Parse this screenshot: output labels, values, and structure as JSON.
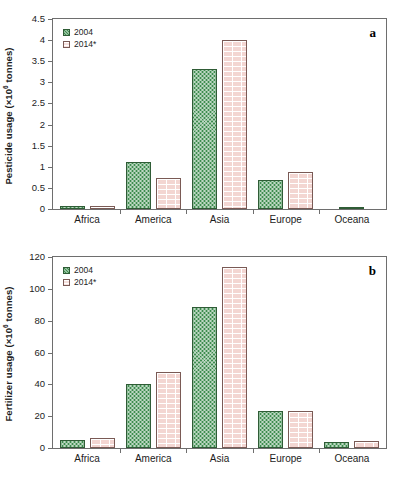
{
  "figure": {
    "background_color": "#ffffff",
    "series_colors": {
      "2004": "#3d8c4e",
      "2014*": "#f3d6d2"
    }
  },
  "panels": [
    {
      "letter": "a",
      "legend": [
        "2004",
        "2014*"
      ],
      "ylabel_pre": "Pesticide usage (×10",
      "ylabel_sup": "6",
      "ylabel_post": " tonnes)",
      "yticks": [
        "4.5",
        "4",
        "3.5",
        "3",
        "2.5",
        "2",
        "1.5",
        "1",
        "0.5",
        "0"
      ],
      "categories": [
        "Africa",
        "America",
        "Asia",
        "Europe",
        "Oceana"
      ]
    },
    {
      "letter": "b",
      "legend": [
        "2004",
        "2014*"
      ],
      "ylabel_pre": "Fertilizer usage (×10",
      "ylabel_sup": "6",
      "ylabel_post": " tonnes)",
      "yticks": [
        "120",
        "100",
        "80",
        "60",
        "40",
        "20",
        "0"
      ],
      "categories": [
        "Africa",
        "America",
        "Asia",
        "Europe",
        "Oceana"
      ]
    }
  ],
  "chart_data": [
    {
      "type": "bar",
      "panel": "a",
      "title": "",
      "xlabel": "",
      "ylabel": "Pesticide usage (×10^6 tonnes)",
      "ylim": [
        0,
        4.5
      ],
      "ytick_values": [
        0,
        0.5,
        1,
        1.5,
        2,
        2.5,
        3,
        3.5,
        4,
        4.5
      ],
      "grid": false,
      "legend_position": "upper-left",
      "annotations": [
        "a"
      ],
      "categories": [
        "Africa",
        "America",
        "Asia",
        "Europe",
        "Oceana"
      ],
      "series": [
        {
          "name": "2004",
          "values": [
            0.06,
            1.11,
            3.32,
            0.69,
            0.04
          ]
        },
        {
          "name": "2014*",
          "values": [
            0.06,
            0.73,
            4.0,
            0.87,
            0.0
          ]
        }
      ]
    },
    {
      "type": "bar",
      "panel": "b",
      "title": "",
      "xlabel": "",
      "ylabel": "Fertilizer usage (×10^6 tonnes)",
      "ylim": [
        0,
        120
      ],
      "ytick_values": [
        0,
        20,
        40,
        60,
        80,
        100,
        120
      ],
      "grid": false,
      "legend_position": "upper-left",
      "annotations": [
        "b"
      ],
      "categories": [
        "Africa",
        "America",
        "Asia",
        "Europe",
        "Oceana"
      ],
      "series": [
        {
          "name": "2004",
          "values": [
            5.0,
            40.3,
            88.5,
            23.0,
            3.8
          ]
        },
        {
          "name": "2014*",
          "values": [
            6.2,
            48.0,
            114.0,
            23.3,
            4.2
          ]
        }
      ]
    }
  ]
}
